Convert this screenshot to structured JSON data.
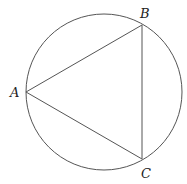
{
  "diagram": {
    "type": "inscribed-triangle-in-circle",
    "circle": {
      "cx": 104,
      "cy": 92,
      "r": 78
    },
    "points": [
      {
        "id": "A",
        "label": "A",
        "x": 26,
        "y": 92,
        "lx": 10,
        "ly": 97
      },
      {
        "id": "B",
        "label": "B",
        "x": 142,
        "y": 25,
        "lx": 140,
        "ly": 18
      },
      {
        "id": "C",
        "label": "C",
        "x": 142,
        "y": 159,
        "lx": 141,
        "ly": 178
      }
    ],
    "stroke_color": "#555555"
  }
}
